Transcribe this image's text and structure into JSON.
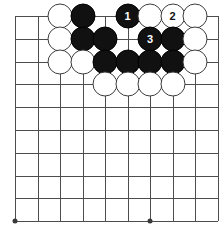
{
  "diagram": {
    "kind": "go-board-diagram",
    "board": {
      "origin_x": 15,
      "origin_y": 16,
      "spacing_x": 22.5,
      "spacing_y": 22.8,
      "cols": 10,
      "rows": 10,
      "line_color": "#4d4d4d",
      "background_color": "#ffffff"
    },
    "star_points": [
      {
        "col": 0,
        "row": 9
      },
      {
        "col": 6,
        "row": 9
      }
    ],
    "stones": [
      {
        "col": 2,
        "row": 0,
        "color": "white",
        "label": ""
      },
      {
        "col": 3,
        "row": 0,
        "color": "black",
        "label": ""
      },
      {
        "col": 5,
        "row": 0,
        "color": "black",
        "label": "1"
      },
      {
        "col": 6,
        "row": 0,
        "color": "white",
        "label": ""
      },
      {
        "col": 7,
        "row": 0,
        "color": "white",
        "label": "2"
      },
      {
        "col": 8,
        "row": 0,
        "color": "white",
        "label": ""
      },
      {
        "col": 2,
        "row": 1,
        "color": "white",
        "label": ""
      },
      {
        "col": 3,
        "row": 1,
        "color": "black",
        "label": ""
      },
      {
        "col": 4,
        "row": 1,
        "color": "black",
        "label": ""
      },
      {
        "col": 6,
        "row": 1,
        "color": "black",
        "label": "3"
      },
      {
        "col": 7,
        "row": 1,
        "color": "black",
        "label": ""
      },
      {
        "col": 8,
        "row": 1,
        "color": "white",
        "label": ""
      },
      {
        "col": 2,
        "row": 2,
        "color": "white",
        "label": ""
      },
      {
        "col": 3,
        "row": 2,
        "color": "white",
        "label": ""
      },
      {
        "col": 4,
        "row": 2,
        "color": "black",
        "label": ""
      },
      {
        "col": 5,
        "row": 2,
        "color": "black",
        "label": ""
      },
      {
        "col": 6,
        "row": 2,
        "color": "black",
        "label": ""
      },
      {
        "col": 7,
        "row": 2,
        "color": "black",
        "label": ""
      },
      {
        "col": 8,
        "row": 2,
        "color": "white",
        "label": ""
      },
      {
        "col": 4,
        "row": 3,
        "color": "white",
        "label": ""
      },
      {
        "col": 5,
        "row": 3,
        "color": "white",
        "label": ""
      },
      {
        "col": 6,
        "row": 3,
        "color": "white",
        "label": ""
      },
      {
        "col": 7,
        "row": 3,
        "color": "white",
        "label": ""
      }
    ],
    "move_labels": [
      {
        "number": "1",
        "color": "black"
      },
      {
        "number": "2",
        "color": "white"
      },
      {
        "number": "3",
        "color": "black"
      }
    ]
  }
}
